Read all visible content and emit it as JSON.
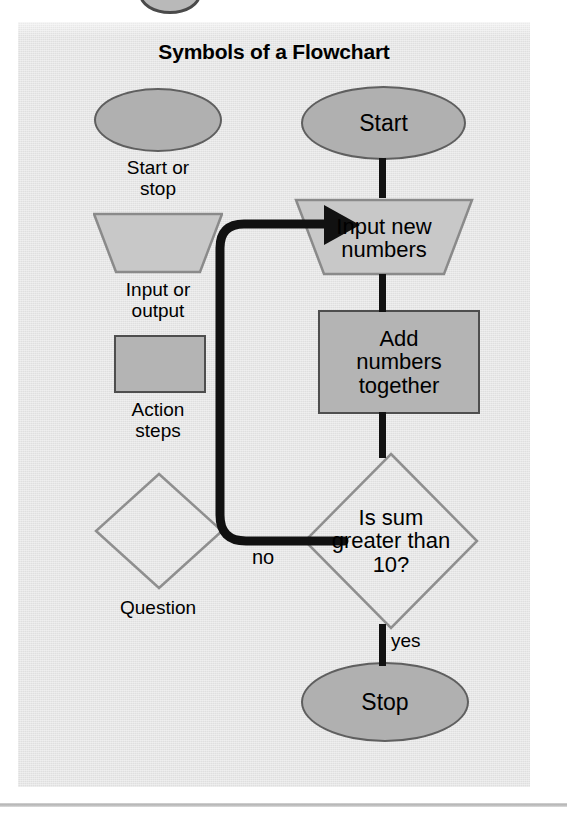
{
  "page": {
    "background_color": "#ffffff",
    "panel_color": "#e5e5e5",
    "rule_color": "#b3b3b3"
  },
  "figure": {
    "title": "Symbols of a Flowchart"
  },
  "palette": {
    "terminator_fill": "#b0b0b0",
    "terminator_stroke": "#5f5f5f",
    "io_fill": "#c8c8c8",
    "io_stroke": "#8a8a8a",
    "process_fill": "#b4b4b4",
    "process_stroke": "#4e4e4e",
    "decision_fill": "none",
    "decision_stroke": "#8f8f8f",
    "connector_color": "#111111",
    "text_color": "#000000"
  },
  "legend": {
    "items": [
      {
        "shape": "ellipse",
        "caption_line1": "Start or",
        "caption_line2": "stop"
      },
      {
        "shape": "trapezoid",
        "caption_line1": "Input or",
        "caption_line2": "output"
      },
      {
        "shape": "rectangle",
        "caption_line1": "Action",
        "caption_line2": "steps"
      },
      {
        "shape": "diamond",
        "caption_line1": "Question",
        "caption_line2": ""
      }
    ]
  },
  "flowchart": {
    "nodes": [
      {
        "id": "start",
        "type": "terminator",
        "line1": "Start",
        "line2": "",
        "line3": ""
      },
      {
        "id": "input",
        "type": "io",
        "line1": "Input new",
        "line2": "numbers",
        "line3": ""
      },
      {
        "id": "add",
        "type": "process",
        "line1": "Add",
        "line2": "numbers",
        "line3": "together"
      },
      {
        "id": "decision",
        "type": "decision",
        "line1": "Is sum",
        "line2": "greater than",
        "line3": "10?"
      },
      {
        "id": "stop",
        "type": "terminator",
        "line1": "Stop",
        "line2": "",
        "line3": ""
      }
    ],
    "edges": [
      {
        "from": "start",
        "to": "input",
        "label": ""
      },
      {
        "from": "input",
        "to": "add",
        "label": ""
      },
      {
        "from": "add",
        "to": "decision",
        "label": ""
      },
      {
        "from": "decision",
        "to": "stop",
        "label": "yes"
      },
      {
        "from": "decision",
        "to": "input",
        "label": "no"
      }
    ],
    "labels": {
      "no": "no",
      "yes": "yes"
    }
  }
}
